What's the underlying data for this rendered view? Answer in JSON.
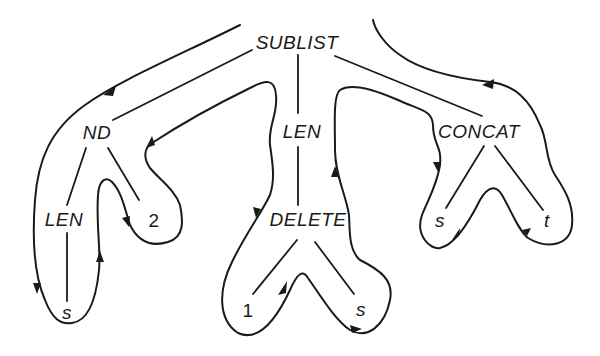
{
  "diagram": {
    "colors": {
      "ink": "#1a1a1a",
      "background": "#ffffff"
    },
    "nodes": [
      {
        "id": "sublist",
        "label": "SUBLIST",
        "x": 300,
        "y": 42
      },
      {
        "id": "nd",
        "label": "ND",
        "x": 97,
        "y": 132
      },
      {
        "id": "len_top",
        "label": "LEN",
        "x": 300,
        "y": 132
      },
      {
        "id": "concat",
        "label": "CONCAT",
        "x": 478,
        "y": 132
      },
      {
        "id": "len_left",
        "label": "LEN",
        "x": 64,
        "y": 219
      },
      {
        "id": "two",
        "label": "2",
        "x": 154,
        "y": 219
      },
      {
        "id": "delete",
        "label": "DELETE",
        "x": 308,
        "y": 219
      },
      {
        "id": "s_left",
        "label": "s",
        "x": 67,
        "y": 312
      },
      {
        "id": "one",
        "label": "1",
        "x": 248,
        "y": 309
      },
      {
        "id": "s_mid",
        "label": "s",
        "x": 361,
        "y": 309
      },
      {
        "id": "s_concat",
        "label": "s",
        "x": 440,
        "y": 220
      },
      {
        "id": "t_concat",
        "label": "t",
        "x": 547,
        "y": 220
      }
    ],
    "edges": [
      [
        "sublist",
        "nd"
      ],
      [
        "sublist",
        "len_top"
      ],
      [
        "sublist",
        "concat"
      ],
      [
        "nd",
        "len_left"
      ],
      [
        "nd",
        "two"
      ],
      [
        "len_left",
        "s_left"
      ],
      [
        "len_top",
        "delete"
      ],
      [
        "delete",
        "one"
      ],
      [
        "delete",
        "s_mid"
      ],
      [
        "concat",
        "s_concat"
      ],
      [
        "concat",
        "t_concat"
      ]
    ],
    "traversal": "Euler-tour contour around tree, counter-clockwise starting left of SUBLIST, ending right of SUBLIST"
  }
}
